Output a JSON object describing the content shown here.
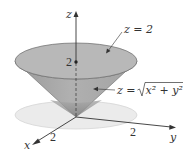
{
  "figure": {
    "type": "3d-surface-diagram",
    "axes": {
      "x": {
        "label": "x",
        "tick": "2"
      },
      "y": {
        "label": "y",
        "tick": "2"
      },
      "z": {
        "label": "z",
        "tick": "2"
      }
    },
    "annotations": {
      "plane_label": "z = 2",
      "cone_label_prefix": "z = ",
      "cone_label_radicand": "x² + y²"
    },
    "colors": {
      "cone_top": "#b3b3b3",
      "cone_side": "#a8a8a8",
      "cone_side_dark": "#8c8c8c",
      "disk": "#e9e9e9",
      "disk_edge": "#d5d5d5",
      "axis": "#333333"
    }
  }
}
